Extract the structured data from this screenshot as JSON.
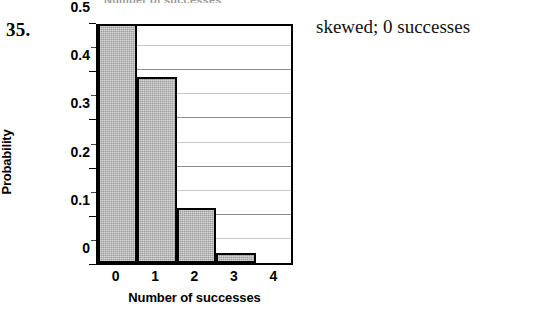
{
  "item_number": "35.",
  "answer_text": "skewed; 0 successes",
  "top_remnant_text": "Number of successes",
  "chart_data": {
    "type": "bar",
    "title": "",
    "xlabel": "Number of successes",
    "ylabel": "Probability",
    "categories": [
      "0",
      "1",
      "2",
      "3",
      "4"
    ],
    "values": [
      0.5,
      0.385,
      0.115,
      0.02,
      0.0
    ],
    "xlim": [
      -0.5,
      4.5
    ],
    "ylim": [
      0,
      0.5
    ],
    "y_ticks": [
      0,
      0.1,
      0.2,
      0.3,
      0.4,
      0.5
    ],
    "y_tick_labels": [
      "0",
      "0.1",
      "0.2",
      "0.3",
      "0.4",
      "0.5"
    ],
    "y_minor_tick_step": 0.05,
    "x_tick_labels": [
      "0",
      "1",
      "2",
      "3",
      "4"
    ],
    "grid": true,
    "grid_axis": "y",
    "grid_step": 0.05,
    "legend": false,
    "bar_fill_color": "#9c9c9c",
    "bar_edge_color": "#000000",
    "plot_border_color": "#000000",
    "background_color": "#ffffff",
    "gridline_color": "#8d8d8d",
    "gridline_minor_color": "#c9c9c9"
  }
}
